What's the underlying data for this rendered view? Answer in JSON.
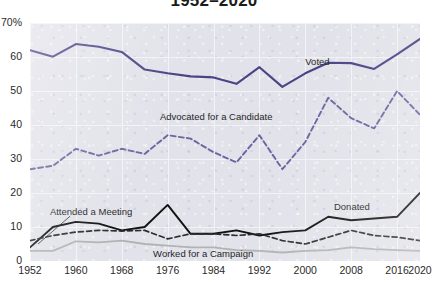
{
  "chart_data": {
    "type": "line",
    "title": "1952–2020",
    "xlabel": "",
    "ylabel": "",
    "xlim": [
      1952,
      2020
    ],
    "ylim": [
      0,
      70
    ],
    "grid": true,
    "legend_position": "inline-annotations",
    "x": [
      1952,
      1956,
      1960,
      1964,
      1968,
      1972,
      1976,
      1980,
      1984,
      1988,
      1992,
      1996,
      2000,
      2004,
      2008,
      2012,
      2016,
      2020
    ],
    "ytick_labels": [
      "70%",
      "60",
      "50",
      "40",
      "30",
      "20",
      "10",
      "0"
    ],
    "ytick_values": [
      70,
      60,
      50,
      40,
      30,
      20,
      10,
      0
    ],
    "xtick_labels": [
      "1952",
      "1960",
      "1968",
      "1976",
      "1984",
      "1992",
      "2000",
      "2008",
      "2016",
      "2020"
    ],
    "xtick_values": [
      1952,
      1960,
      1968,
      1976,
      1984,
      1992,
      2000,
      2008,
      2016,
      2020
    ],
    "series": [
      {
        "name": "Voted",
        "style": "solid",
        "color": "#4a4385",
        "width": 2.1,
        "values": [
          62.0,
          60.1,
          63.8,
          63.0,
          61.5,
          56.3,
          55.2,
          54.3,
          54.0,
          52.1,
          57.0,
          51.2,
          55.2,
          58.3,
          58.2,
          56.5,
          60.8,
          65.3
        ],
        "label": "Voted",
        "label_x": 2000,
        "label_y": 58.5
      },
      {
        "name": "Advocated for a Candidate",
        "style": "dashed",
        "color": "#6b64a0",
        "width": 1.9,
        "values": [
          27.0,
          28.0,
          33.0,
          31.0,
          33.0,
          31.5,
          37.0,
          36.0,
          32.0,
          29.0,
          37.0,
          27.0,
          35.0,
          48.0,
          42.0,
          39.0,
          50.0,
          43.0
        ],
        "label": "Advocated for a Candidate",
        "label_x": 1990,
        "label_y": 42.5
      },
      {
        "name": "Donated",
        "style": "solid",
        "color": "#111111",
        "width": 1.9,
        "values": [
          4.0,
          10.0,
          11.5,
          11.0,
          9.0,
          10.0,
          16.5,
          8.0,
          8.0,
          9.0,
          7.5,
          8.5,
          9.0,
          13.0,
          12.0,
          12.5,
          13.0,
          20.0
        ],
        "label": "Donated",
        "label_x": 2005,
        "label_y": 16.0
      },
      {
        "name": "Attended a Meeting",
        "style": "dashed",
        "color": "#2b2b2b",
        "width": 1.7,
        "values": [
          6.0,
          7.5,
          8.5,
          9.0,
          8.8,
          9.0,
          6.5,
          8.0,
          8.0,
          7.5,
          8.0,
          6.0,
          5.0,
          7.0,
          9.0,
          7.5,
          7.0,
          6.0
        ],
        "label": "Attended a Meeting",
        "label_x": 1960,
        "label_y": 14.5
      },
      {
        "name": "Worked for a Campaign",
        "style": "solid",
        "color": "#b2b2b2",
        "width": 1.8,
        "values": [
          3.0,
          3.0,
          5.8,
          5.5,
          6.0,
          5.0,
          4.5,
          4.0,
          4.0,
          3.2,
          3.0,
          2.5,
          3.0,
          3.2,
          4.0,
          3.5,
          3.2,
          3.0
        ],
        "label": "Worked for a Campaign",
        "label_x": 1978,
        "label_y": 2.2
      }
    ]
  }
}
